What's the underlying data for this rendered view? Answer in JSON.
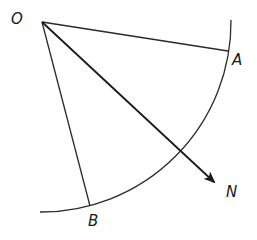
{
  "diagram": {
    "type": "geometry-sector-bearing",
    "labels": {
      "O": "O",
      "A": "A",
      "B": "B",
      "N": "N"
    },
    "points": {
      "O": [
        42,
        22
      ],
      "A": [
        227,
        51
      ],
      "B": [
        90,
        206
      ],
      "N_arrow_tip": [
        215,
        183
      ]
    },
    "arc": {
      "start": [
        231,
        22
      ],
      "end": [
        40,
        212
      ],
      "description": "circular arc centered at O"
    },
    "segments": [
      {
        "from": "O",
        "to": "A"
      },
      {
        "from": "O",
        "to": "B"
      }
    ],
    "arrows": [
      {
        "from": "O",
        "to": "N",
        "label": "N"
      }
    ],
    "colors": {
      "stroke": "#2a2a2a",
      "background": "#ffffff"
    }
  }
}
